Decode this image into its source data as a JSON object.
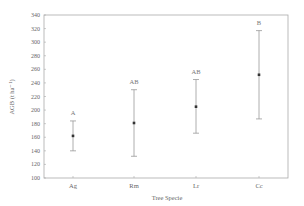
{
  "chart_data": {
    "type": "scatter",
    "subtype": "point_with_error_bars",
    "title": "",
    "xlabel": "Tree Specie",
    "ylabel": "AGB (t ha⁻¹)",
    "ylim": [
      100,
      340
    ],
    "yticks": [
      100,
      120,
      140,
      160,
      180,
      200,
      220,
      240,
      260,
      280,
      300,
      320,
      340
    ],
    "grid": false,
    "legend": null,
    "categories": [
      "Ag",
      "Rm",
      "Lr",
      "Cc"
    ],
    "series": [
      {
        "name": "AGB",
        "values": [
          162,
          181,
          205,
          252
        ],
        "error_low": [
          140,
          132,
          166,
          187
        ],
        "error_high": [
          184,
          230,
          245,
          317
        ],
        "significance_labels": [
          "A",
          "AB",
          "AB",
          "B"
        ]
      }
    ]
  },
  "labels": {
    "xlabel": "Tree Specie",
    "ylabel": "AGB (t ha⁻¹)"
  }
}
